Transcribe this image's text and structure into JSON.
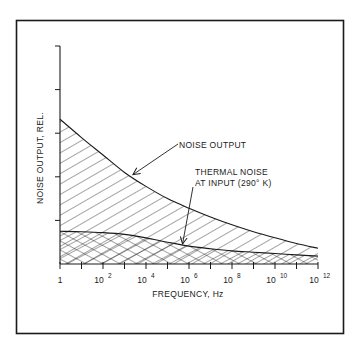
{
  "chart_data": {
    "type": "area",
    "title": "",
    "xlabel": "FREQUENCY, Hz",
    "ylabel": "NOISE OUTPUT, REL.",
    "x_scale": "log",
    "x_unit": "Hz",
    "xlim_log10": [
      0,
      12
    ],
    "ylim": [
      0,
      5
    ],
    "x_ticks_log10": [
      0,
      1,
      2,
      3,
      4,
      5,
      6,
      7,
      8,
      9,
      10,
      11,
      12
    ],
    "x_tick_labels": [
      {
        "log10": 0,
        "base": "1",
        "exp": ""
      },
      {
        "log10": 2,
        "base": "10",
        "exp": "2"
      },
      {
        "log10": 4,
        "base": "10",
        "exp": "4"
      },
      {
        "log10": 6,
        "base": "10",
        "exp": "6"
      },
      {
        "log10": 8,
        "base": "10",
        "exp": "8"
      },
      {
        "log10": 10,
        "base": "10",
        "exp": "10"
      },
      {
        "log10": 12,
        "base": "10",
        "exp": "12"
      }
    ],
    "y_ticks": [
      0,
      1,
      2,
      3,
      4,
      5
    ],
    "grid": false,
    "series": [
      {
        "name": "NOISE OUTPUT",
        "fill": "single-hatch",
        "x_log10": [
          0,
          1,
          2,
          3,
          4,
          5,
          6,
          7,
          8,
          9,
          10,
          11,
          12
        ],
        "values": [
          3.32,
          2.9,
          2.5,
          2.1,
          1.78,
          1.5,
          1.28,
          1.08,
          0.9,
          0.74,
          0.6,
          0.47,
          0.36
        ]
      },
      {
        "name": "THERMAL NOISE AT INPUT (290° K)",
        "fill": "cross-hatch",
        "x_log10": [
          0,
          1,
          2,
          3,
          4,
          5,
          6,
          7,
          8,
          9,
          10,
          11,
          12
        ],
        "values": [
          0.75,
          0.74,
          0.72,
          0.68,
          0.6,
          0.5,
          0.41,
          0.35,
          0.3,
          0.27,
          0.24,
          0.21,
          0.18
        ]
      }
    ],
    "annotations": [
      {
        "text": "NOISE OUTPUT",
        "points_to_series": "NOISE OUTPUT",
        "arrow_target_log10": 3.3
      },
      {
        "text": [
          "THERMAL NOISE",
          "AT INPUT (290° K)"
        ],
        "points_to_series": "THERMAL NOISE AT INPUT (290° K)",
        "arrow_target_log10": 5.7
      }
    ]
  },
  "colors": {
    "ink": "#1a1a1a",
    "background": "#ffffff"
  }
}
